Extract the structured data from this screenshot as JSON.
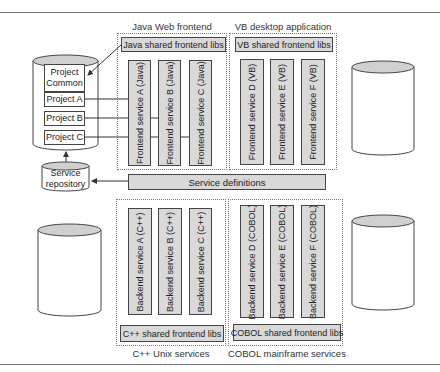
{
  "diagram": {
    "groups": {
      "java": {
        "label": "Java Web frontend",
        "shared_libs": "Java shared frontend libs",
        "services": [
          "Frontend service A (Java)",
          "Frontend service B (Java)",
          "Frontend service C (Java)"
        ]
      },
      "vb": {
        "label": "VB desktop application",
        "shared_libs": "VB shared frontend libs",
        "services": [
          "Frontend service D (VB)",
          "Frontend service E (VB)",
          "Frontend service F (VB)"
        ]
      },
      "cpp": {
        "label": "C++ Unix services",
        "shared_libs": "C++ shared frontend libs",
        "services": [
          "Backend service A (C++)",
          "Backend service B (C++)",
          "Backend service C (C++)"
        ]
      },
      "cobol": {
        "label": "COBOL mainframe services",
        "shared_libs": "COBOL shared frontend libs",
        "services": [
          "Backend service D (COBOL)",
          "Backend service E (COBOL)",
          "Backend service F (COBOL)"
        ]
      }
    },
    "service_definitions": "Service definitions",
    "repository": {
      "projects": [
        "Project Common",
        "Project A",
        "Project B",
        "Project C"
      ],
      "service_repository": "Service repository"
    },
    "colors": {
      "box_fill": "#d9d9d9",
      "cylinder_top": "#d0d0d0",
      "stroke": "#444444"
    }
  }
}
